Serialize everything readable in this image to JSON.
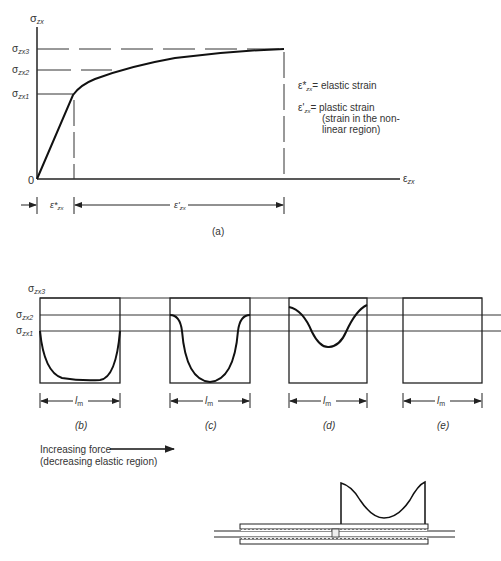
{
  "panel_a": {
    "y_axis_label": "σ",
    "y_axis_sub": "zx",
    "x_axis_label": "ε",
    "x_axis_sub": "zx",
    "origin_label": "0",
    "levels": [
      {
        "label": "σ",
        "sub": "zx3"
      },
      {
        "label": "σ",
        "sub": "zx2"
      },
      {
        "label": "σ",
        "sub": "zx1"
      }
    ],
    "legend": {
      "elastic": {
        "sym": "ε*",
        "sub": "zx",
        "text": "= elastic strain"
      },
      "plastic": {
        "sym": "ε'",
        "sub": "zx",
        "text": "= plastic strain"
      },
      "plastic_note_1": "(strain in the non-",
      "plastic_note_2": "linear region)"
    },
    "dim_elastic": {
      "sym": "ε*",
      "sub": "zx"
    },
    "dim_plastic": {
      "sym": "ε'",
      "sub": "zx"
    },
    "caption": "(a)"
  },
  "panels_bottom": {
    "levels": [
      {
        "label": "σ",
        "sub": "zx3"
      },
      {
        "label": "σ",
        "sub": "zx2"
      },
      {
        "label": "σ",
        "sub": "zx1"
      }
    ],
    "length_label": "l",
    "length_sub": "m",
    "captions": [
      "(b)",
      "(c)",
      "(d)",
      "(e)"
    ]
  },
  "note": {
    "line1": "Increasing force",
    "line2": "(decreasing elastic region)"
  }
}
